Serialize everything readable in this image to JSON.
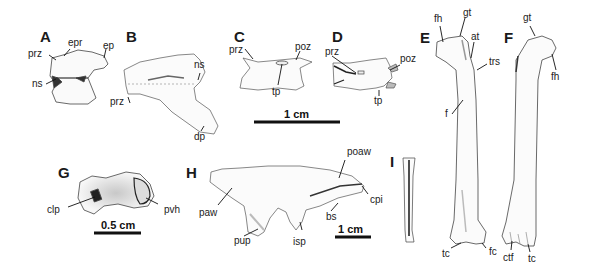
{
  "figure": {
    "panels": {
      "A": {
        "letter": "A",
        "labels": {
          "epr": "epr",
          "ep": "ep",
          "prz": "prz",
          "ns": "ns"
        }
      },
      "B": {
        "letter": "B",
        "labels": {
          "ns": "ns",
          "prz": "prz",
          "dp": "dp"
        }
      },
      "C": {
        "letter": "C",
        "labels": {
          "prz": "prz",
          "poz": "poz",
          "tp": "tp"
        }
      },
      "D": {
        "letter": "D",
        "labels": {
          "prz": "prz",
          "poz": "poz",
          "tp": "tp"
        }
      },
      "E": {
        "letter": "E",
        "labels": {
          "fh": "fh",
          "gt": "gt",
          "at": "at",
          "trs": "trs",
          "f": "f",
          "tc": "tc",
          "fc": "fc"
        }
      },
      "F": {
        "letter": "F",
        "labels": {
          "gt": "gt",
          "fh": "fh",
          "ctf": "ctf",
          "tc": "tc"
        }
      },
      "G": {
        "letter": "G",
        "labels": {
          "clp": "clp",
          "pvh": "pvh"
        }
      },
      "H": {
        "letter": "H",
        "labels": {
          "poaw": "poaw",
          "paw": "paw",
          "cpi": "cpi",
          "bs": "bs",
          "pup": "pup",
          "isp": "isp"
        }
      },
      "I": {
        "letter": "I"
      }
    },
    "scale_bars": {
      "cd": "1 cm",
      "g": "0.5 cm",
      "h": "1 cm"
    },
    "colors": {
      "ink": "#1a1a1a",
      "bone_fill": "#fafafa",
      "shade": "#bdbdbd"
    }
  }
}
